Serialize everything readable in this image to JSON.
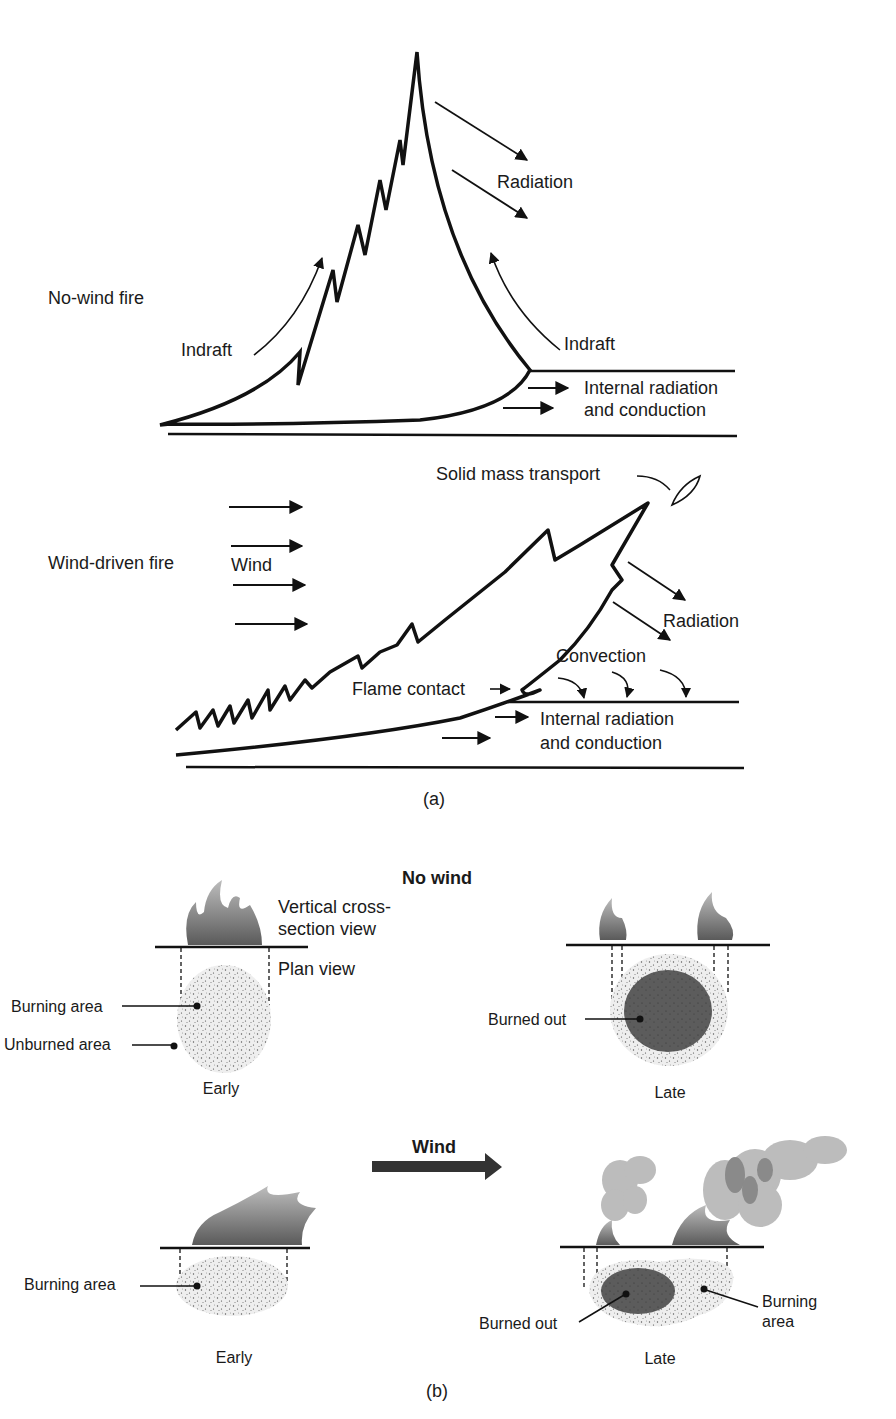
{
  "panel_a": {
    "caption": "(a)",
    "no_wind": {
      "title": "No-wind fire",
      "radiation": "Radiation",
      "indraft_left": "Indraft",
      "indraft_right": "Indraft",
      "internal_1": "Internal radiation",
      "internal_2": "and conduction"
    },
    "wind_driven": {
      "title": "Wind-driven fire",
      "wind": "Wind",
      "solid_mass": "Solid mass transport",
      "radiation": "Radiation",
      "convection": "Convection",
      "flame_contact": "Flame contact",
      "internal_1": "Internal radiation",
      "internal_2": "and conduction"
    }
  },
  "panel_b": {
    "caption": "(b)",
    "no_wind_title": "No wind",
    "wind_title": "Wind",
    "vertical_1": "Vertical cross-",
    "vertical_2": "section view",
    "plan_view": "Plan view",
    "burning_area": "Burning area",
    "unburned_area": "Unburned area",
    "burned_out": "Burned out",
    "early": "Early",
    "late": "Late",
    "wind_burning_area": "Burning area",
    "wind_burned_out": "Burned out",
    "wind_burning_1": "Burning",
    "wind_burning_2": "area",
    "wind_early": "Early",
    "wind_late": "Late"
  },
  "colors": {
    "ink": "#111111",
    "speckle_fill": "#ececec",
    "burned_out": "#5c5c5c",
    "flame": "#8a8a8a",
    "smoke": "#b5b5b5"
  }
}
